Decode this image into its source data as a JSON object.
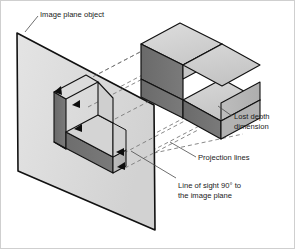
{
  "figure": {
    "type": "technical-illustration",
    "background_color": "#ffffff",
    "border_color": "#cfcfcf"
  },
  "labels": {
    "image_plane_object": "Image plane object",
    "lost_depth_line1": "Lost depth",
    "lost_depth_line2": "dimension",
    "projection_lines": "Projection lines",
    "line_of_sight_line1": "Line of sight 90° to",
    "line_of_sight_line2": "the image plane"
  },
  "colors": {
    "plane_fill": "#d9d9d9",
    "plane_fill_light": "#e3e3e3",
    "outline": "#111111",
    "block_top": "#d2d2d2",
    "block_top_light": "#dcdcdc",
    "block_front_dark": "#6e6e6e",
    "block_side": "#b8b8b8",
    "flat_dark_face": "#6e6e6e",
    "dashed_line": "#7a7a7a",
    "leader_line": "#4a4a4a",
    "text": "#1a1a1a"
  },
  "geometry": {
    "image_plane_corners": [
      [
        17,
        33
      ],
      [
        154,
        105
      ],
      [
        155,
        230
      ],
      [
        18,
        171
      ]
    ],
    "projection_dash_pattern": "4 3",
    "block_description": "isometric stepped L-block (upper riser + lower slab)",
    "flat_shape_description": "L-shaped projected outline on image plane with extruded dark faces",
    "arrowhead_count": 4
  }
}
